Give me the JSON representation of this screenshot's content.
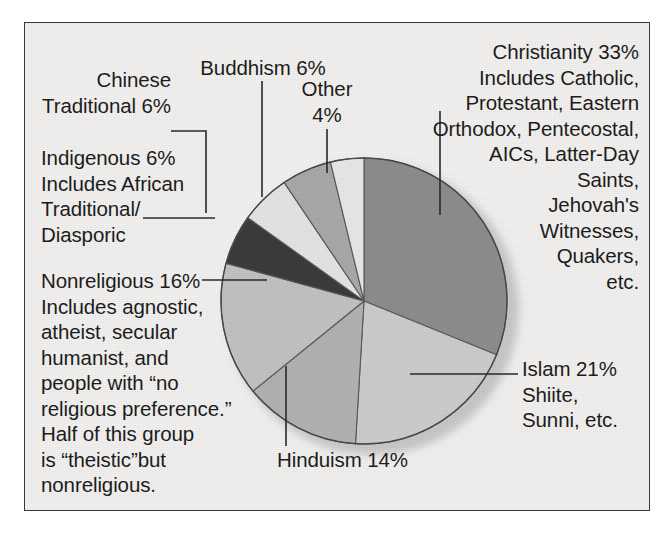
{
  "figure": {
    "background": "#f2f1ef",
    "border_color": "#3a3a3a",
    "text_color": "#1d1d1d"
  },
  "chart_data": {
    "type": "pie",
    "title": "",
    "xlabel": "",
    "ylabel": "",
    "grid": false,
    "legend": "none",
    "units": "percent",
    "start_angle_deg": 0,
    "direction": "clockwise",
    "categories": [
      "Christianity",
      "Islam",
      "Hinduism",
      "Nonreligious",
      "Indigenous",
      "Chinese Traditional",
      "Buddhism",
      "Other"
    ],
    "values": [
      33,
      21,
      14,
      16,
      6,
      6,
      6,
      4
    ],
    "colors": [
      "#8d8d8d",
      "#cdcdcb",
      "#b2b2b0",
      "#c2c2c0",
      "#3b3b3b",
      "#e4e4e2",
      "#a9a9a7",
      "#e8e8e6"
    ],
    "slices": [
      {
        "label": "Christianity",
        "value": 33,
        "display": "Christianity 33%",
        "color": "#8d8d8d"
      },
      {
        "label": "Islam",
        "value": 21,
        "display": "Islam 21%",
        "color": "#cdcdcb"
      },
      {
        "label": "Hinduism",
        "value": 14,
        "display": "Hinduism 14%",
        "color": "#b2b2b0"
      },
      {
        "label": "Nonreligious",
        "value": 16,
        "display": "Nonreligious 16%",
        "color": "#c2c2c0"
      },
      {
        "label": "Indigenous",
        "value": 6,
        "display": "Indigenous 6%",
        "color": "#3b3b3b"
      },
      {
        "label": "Chinese Traditional",
        "value": 6,
        "display": "Chinese Traditional 6%",
        "color": "#e4e4e2"
      },
      {
        "label": "Buddhism",
        "value": 6,
        "display": "Buddhism 6%",
        "color": "#a9a9a7"
      },
      {
        "label": "Other",
        "value": 4,
        "display": "Other 4%",
        "color": "#e8e8e6"
      }
    ]
  },
  "labels": {
    "christianity": "Christianity 33%\nIncludes Catholic,\nProtestant, Eastern\nOrthodox, Pentecostal,\nAICs, Latter-Day\nSaints,\nJehovah's\nWitnesses,\nQuakers,\netc.",
    "islam": "Islam 21%\nShiite,\nSunni, etc.",
    "hinduism": "Hinduism 14%",
    "nonreligious": "Nonreligious 16%\nIncludes agnostic,\natheist, secular\nhumanist, and\npeople with “no\nreligious preference.”\nHalf of this group\nis “theistic”but\nnonreligious.",
    "indigenous": "Indigenous 6%\nIncludes African\nTraditional/\nDiasporic",
    "chinese_traditional": "Chinese\nTraditional 6%",
    "buddhism": "Buddhism 6%",
    "other": "Other\n4%"
  }
}
